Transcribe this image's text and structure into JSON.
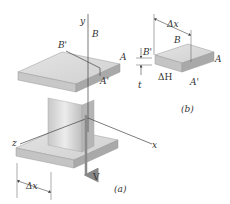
{
  "figure": {
    "type": "I-beam shear flow diagram",
    "panels": [
      {
        "id": "a",
        "caption": "(a)"
      },
      {
        "id": "b",
        "caption": "(b)"
      }
    ]
  },
  "panel_a": {
    "axis_y": "y",
    "axis_z": "z",
    "axis_x": "x",
    "label_B": "B",
    "label_B_prime": "B'",
    "label_A": "A",
    "label_A_prime": "A'",
    "shear_force": "V",
    "dim_dx": "Δx",
    "caption": "(a)"
  },
  "panel_b": {
    "dim_dx": "Δx",
    "label_B": "B",
    "label_B_prime": "B'",
    "label_A": "A",
    "label_A_prime": "A'",
    "thickness": "t",
    "shear_force_increment": "ΔH",
    "caption": "(b)"
  },
  "colors": {
    "beam_light": "#e6e6e6",
    "beam_mid": "#cfcfcf",
    "beam_dark": "#a8a8a8",
    "line": "#444444",
    "arrow": "#888888"
  }
}
